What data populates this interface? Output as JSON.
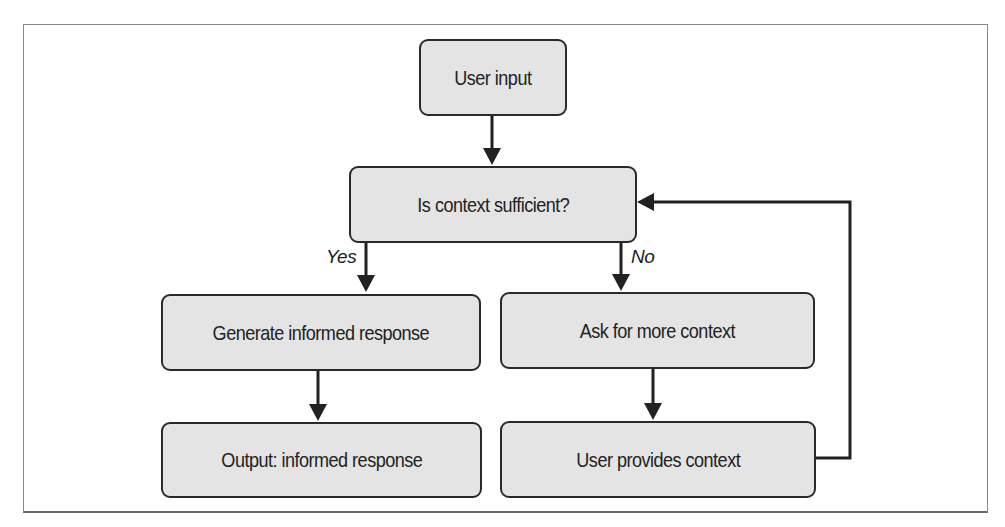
{
  "diagram": {
    "type": "flowchart",
    "nodes": {
      "user_input": "User input",
      "is_context_sufficient": "Is context sufficient?",
      "generate_informed_response": "Generate informed response",
      "ask_for_more_context": "Ask for more context",
      "output_informed_response": "Output: informed response",
      "user_provides_context": "User provides context"
    },
    "edge_labels": {
      "yes": "Yes",
      "no": "No"
    },
    "edges": [
      {
        "from": "user_input",
        "to": "is_context_sufficient",
        "label": ""
      },
      {
        "from": "is_context_sufficient",
        "to": "generate_informed_response",
        "label": "Yes"
      },
      {
        "from": "is_context_sufficient",
        "to": "ask_for_more_context",
        "label": "No"
      },
      {
        "from": "generate_informed_response",
        "to": "output_informed_response",
        "label": ""
      },
      {
        "from": "ask_for_more_context",
        "to": "user_provides_context",
        "label": ""
      },
      {
        "from": "user_provides_context",
        "to": "is_context_sufficient",
        "label": ""
      }
    ],
    "colors": {
      "node_fill": "#e4e4e4",
      "node_border": "#2a2a2a",
      "edge": "#222222",
      "text": "#222222",
      "frame": "#8a8a8a"
    }
  }
}
